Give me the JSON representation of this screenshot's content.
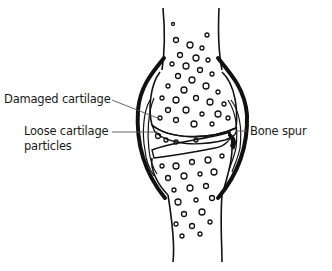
{
  "diagram": {
    "labels": {
      "damaged_cartilage": "Damaged cartilage",
      "loose_particles_line1": "Loose cartilage",
      "loose_particles_line2": "particles",
      "bone_spur": "Bone spur"
    },
    "colors": {
      "ink": "#111111",
      "background": "#ffffff",
      "leader": "#555555"
    }
  }
}
